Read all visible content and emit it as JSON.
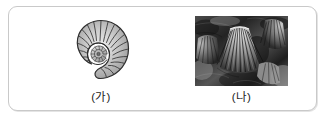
{
  "figure": {
    "panel_border_color": "#c9c9c9",
    "background_color": "#ffffff",
    "specimens": [
      {
        "id": "specimen-a",
        "caption": "(가)",
        "media_kind": "line-illustration",
        "subject": "ammonite-fossil",
        "icon_name": "ammonite-spiral-shell-icon",
        "palette": {
          "outline": "#2e2e2e",
          "shell_light": "#e8e8e8",
          "shell_mid": "#b4b4b4",
          "shell_dark": "#7e7e7e"
        }
      },
      {
        "id": "specimen-b",
        "caption": "(나)",
        "media_kind": "photograph",
        "subject": "brachiopod-fossil-bed",
        "icon_name": "brachiopod-fan-shell-photo",
        "palette": {
          "rock_dark": "#232323",
          "rock_mid": "#5d5d5d",
          "rock_light": "#d6d6d6",
          "shell_highlight": "#efefef"
        }
      }
    ]
  }
}
